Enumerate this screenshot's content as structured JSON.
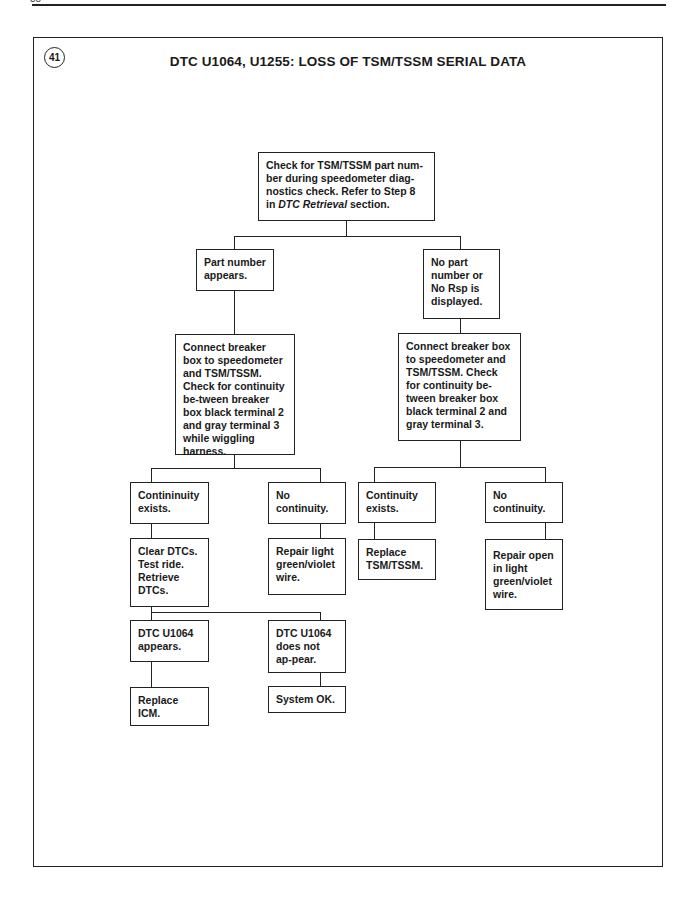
{
  "page": {
    "page_number": "38",
    "badge": "41",
    "title": "DTC U1064, U1255: LOSS OF TSM/TSSM SERIAL DATA"
  },
  "flowchart": {
    "start": {
      "text_a": "Check for TSM/TSSM part num-ber during speedometer diag-nostics check. Refer to Step 8 in ",
      "text_italic": "DTC Retrieval",
      "text_b": " section."
    },
    "left_branch": {
      "condition": "Part number appears.",
      "test": "Connect breaker box to speedometer and TSM/TSSM. Check for continuity be-tween breaker box black terminal 2 and gray terminal 3 while wiggling harness.",
      "yes": {
        "condition": "Contininuity exists.",
        "action": "Clear DTCs. Test ride. Retrieve DTCs.",
        "outcomes": [
          {
            "condition": "DTC U1064 appears.",
            "action": "Replace ICM."
          },
          {
            "condition": "DTC U1064 does not ap-pear.",
            "action": "System OK."
          }
        ]
      },
      "no": {
        "condition": "No continuity.",
        "action": "Repair light green/violet wire."
      }
    },
    "right_branch": {
      "condition": "No part number or No Rsp is displayed.",
      "test": "Connect breaker box to speedometer and TSM/TSSM. Check for continuity be-tween breaker box black terminal 2 and gray terminal 3.",
      "yes": {
        "condition": "Continuity exists.",
        "action": "Replace TSM/TSSM."
      },
      "no": {
        "condition": "No continuity.",
        "action": "Repair open in light green/violet wire."
      }
    }
  }
}
